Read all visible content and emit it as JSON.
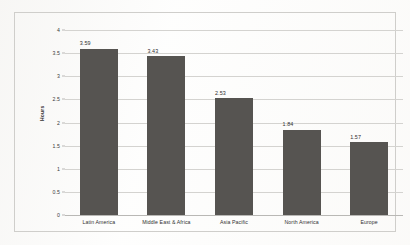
{
  "chart_data": {
    "type": "bar",
    "title": "",
    "xlabel": "",
    "ylabel": "Hours",
    "categories": [
      "Latin America",
      "Middle East & Africa",
      "Asia Pacific",
      "North America",
      "Europe"
    ],
    "values": [
      3.59,
      3.43,
      2.53,
      1.84,
      1.57
    ],
    "value_labels": [
      "3.59",
      "3.43",
      "2.53",
      "1.84",
      "1.57"
    ],
    "ylim": [
      0,
      4
    ],
    "ytick_values": [
      0,
      0.5,
      1,
      1.5,
      2,
      2.5,
      3,
      3.5,
      4
    ],
    "ytick_labels": [
      "0",
      "0.5",
      "1",
      "1.5",
      "2",
      "2.5",
      "3",
      "3.5",
      "4"
    ],
    "grid": "horizontal",
    "legend": "none",
    "bar_color": "#565451",
    "gridline_color": "#d4d3d0",
    "frame_color": "#cfcecb",
    "background_color": "#ffffff"
  }
}
